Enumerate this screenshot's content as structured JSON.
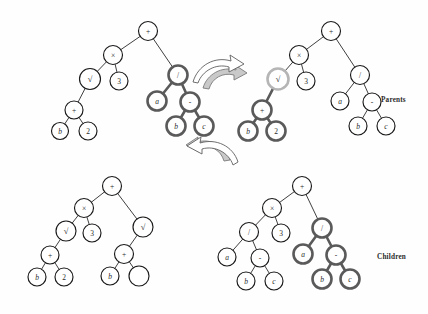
{
  "figure": {
    "type": "genetic-programming-crossover-diagram",
    "background": "#fefefe",
    "width": 428,
    "height": 314,
    "colors": {
      "node_stroke": "#1a1a1a",
      "node_fill": "#ffffff",
      "edge": "#2a2a2a",
      "highlight_bold": "#5a5a5a",
      "highlight_light": "#b5b5b5",
      "arrow_fill": "#c9c9c9",
      "arrow_stroke": "#6e6e6e",
      "text": "#2b2b2b"
    }
  },
  "labels": {
    "parents": "Parents",
    "children": "Children"
  },
  "icons": {
    "swap_arrow_top": "curved-swap-arrow-icon",
    "swap_arrow_bottom": "curved-swap-arrow-icon"
  },
  "trees": [
    {
      "id": "parent-1",
      "name": "parent-tree-left",
      "row": "parents",
      "nodes": [
        {
          "id": "p1-n0",
          "label": "+",
          "x": 148,
          "y": 31,
          "r": 9.5,
          "style": "normal"
        },
        {
          "id": "p1-n1",
          "label": "×",
          "x": 113,
          "y": 55,
          "r": 9.5,
          "style": "normal"
        },
        {
          "id": "p1-n2",
          "label": "√",
          "x": 90,
          "y": 79,
          "r": 10.5,
          "style": "normal"
        },
        {
          "id": "p1-n3",
          "label": "3",
          "x": 119,
          "y": 81,
          "r": 9.0,
          "style": "normal"
        },
        {
          "id": "p1-n4",
          "label": "+",
          "x": 74,
          "y": 110,
          "r": 9.0,
          "style": "normal"
        },
        {
          "id": "p1-n5",
          "label": "b",
          "x": 60,
          "y": 131,
          "r": 8.5,
          "style": "normal"
        },
        {
          "id": "p1-n6",
          "label": "2",
          "x": 88,
          "y": 131,
          "r": 9.0,
          "style": "normal"
        },
        {
          "id": "p1-n7",
          "label": "/",
          "x": 178,
          "y": 75,
          "r": 9.5,
          "style": "highlight-bold"
        },
        {
          "id": "p1-n8",
          "label": "a",
          "x": 157,
          "y": 101,
          "r": 9.5,
          "style": "highlight-bold"
        },
        {
          "id": "p1-n9",
          "label": "-",
          "x": 190,
          "y": 102,
          "r": 9.5,
          "style": "highlight-bold"
        },
        {
          "id": "p1-n10",
          "label": "b",
          "x": 176,
          "y": 126,
          "r": 9.5,
          "style": "highlight-bold"
        },
        {
          "id": "p1-n11",
          "label": "c",
          "x": 204,
          "y": 126,
          "r": 9.5,
          "style": "highlight-bold"
        }
      ],
      "edges": [
        {
          "from": "p1-n0",
          "to": "p1-n1",
          "style": "normal"
        },
        {
          "from": "p1-n0",
          "to": "p1-n7",
          "style": "normal"
        },
        {
          "from": "p1-n1",
          "to": "p1-n2",
          "style": "normal"
        },
        {
          "from": "p1-n1",
          "to": "p1-n3",
          "style": "normal"
        },
        {
          "from": "p1-n2",
          "to": "p1-n4",
          "style": "normal"
        },
        {
          "from": "p1-n4",
          "to": "p1-n5",
          "style": "normal"
        },
        {
          "from": "p1-n4",
          "to": "p1-n6",
          "style": "normal"
        },
        {
          "from": "p1-n7",
          "to": "p1-n8",
          "style": "highlight-bold"
        },
        {
          "from": "p1-n7",
          "to": "p1-n9",
          "style": "highlight-bold"
        },
        {
          "from": "p1-n9",
          "to": "p1-n10",
          "style": "highlight-bold"
        },
        {
          "from": "p1-n9",
          "to": "p1-n11",
          "style": "highlight-bold"
        }
      ]
    },
    {
      "id": "parent-2",
      "name": "parent-tree-right",
      "row": "parents",
      "nodes": [
        {
          "id": "p2-n0",
          "label": "+",
          "x": 331,
          "y": 31,
          "r": 9.5,
          "style": "normal"
        },
        {
          "id": "p2-n1",
          "label": "×",
          "x": 299,
          "y": 55,
          "r": 9.5,
          "style": "normal"
        },
        {
          "id": "p2-n2",
          "label": "√",
          "x": 278,
          "y": 79,
          "r": 10.5,
          "style": "highlight-light"
        },
        {
          "id": "p2-n3",
          "label": "3",
          "x": 306,
          "y": 81,
          "r": 9.0,
          "style": "normal"
        },
        {
          "id": "p2-n4",
          "label": "+",
          "x": 262,
          "y": 110,
          "r": 9.5,
          "style": "highlight-bold"
        },
        {
          "id": "p2-n5",
          "label": "b",
          "x": 248,
          "y": 131,
          "r": 9.5,
          "style": "highlight-bold"
        },
        {
          "id": "p2-n6",
          "label": "2",
          "x": 276,
          "y": 131,
          "r": 9.5,
          "style": "highlight-bold"
        },
        {
          "id": "p2-n7",
          "label": "/",
          "x": 360,
          "y": 75,
          "r": 9.5,
          "style": "normal"
        },
        {
          "id": "p2-n8",
          "label": "a",
          "x": 340,
          "y": 101,
          "r": 9.0,
          "style": "normal"
        },
        {
          "id": "p2-n9",
          "label": "-",
          "x": 372,
          "y": 102,
          "r": 9.0,
          "style": "normal"
        },
        {
          "id": "p2-n10",
          "label": "b",
          "x": 358,
          "y": 126,
          "r": 9.0,
          "style": "normal"
        },
        {
          "id": "p2-n11",
          "label": "c",
          "x": 386,
          "y": 126,
          "r": 9.0,
          "style": "normal"
        }
      ],
      "edges": [
        {
          "from": "p2-n0",
          "to": "p2-n1",
          "style": "normal"
        },
        {
          "from": "p2-n0",
          "to": "p2-n7",
          "style": "normal"
        },
        {
          "from": "p2-n1",
          "to": "p2-n2",
          "style": "normal"
        },
        {
          "from": "p2-n1",
          "to": "p2-n3",
          "style": "normal"
        },
        {
          "from": "p2-n2",
          "to": "p2-n4",
          "style": "highlight-bold"
        },
        {
          "from": "p2-n4",
          "to": "p2-n5",
          "style": "highlight-bold"
        },
        {
          "from": "p2-n4",
          "to": "p2-n6",
          "style": "highlight-bold"
        },
        {
          "from": "p2-n7",
          "to": "p2-n8",
          "style": "normal"
        },
        {
          "from": "p2-n7",
          "to": "p2-n9",
          "style": "normal"
        },
        {
          "from": "p2-n9",
          "to": "p2-n10",
          "style": "normal"
        },
        {
          "from": "p2-n9",
          "to": "p2-n11",
          "style": "normal"
        }
      ]
    },
    {
      "id": "child-1",
      "name": "child-tree-left",
      "row": "children",
      "nodes": [
        {
          "id": "c1-n0",
          "label": "+",
          "x": 112,
          "y": 186,
          "r": 9.5,
          "style": "normal"
        },
        {
          "id": "c1-n1",
          "label": "×",
          "x": 84,
          "y": 208,
          "r": 9.5,
          "style": "normal"
        },
        {
          "id": "c1-n2",
          "label": "√",
          "x": 66,
          "y": 231,
          "r": 10.0,
          "style": "normal"
        },
        {
          "id": "c1-n3",
          "label": "3",
          "x": 92,
          "y": 233,
          "r": 9.0,
          "style": "normal"
        },
        {
          "id": "c1-n4",
          "label": "+",
          "x": 50,
          "y": 255,
          "r": 9.0,
          "style": "normal"
        },
        {
          "id": "c1-n5",
          "label": "b",
          "x": 37,
          "y": 277,
          "r": 9.0,
          "style": "normal"
        },
        {
          "id": "c1-n6",
          "label": "2",
          "x": 64,
          "y": 277,
          "r": 9.0,
          "style": "normal"
        },
        {
          "id": "c1-n7",
          "label": "√",
          "x": 143,
          "y": 227,
          "r": 10.0,
          "style": "normal"
        },
        {
          "id": "c1-n8",
          "label": "+",
          "x": 124,
          "y": 254,
          "r": 9.5,
          "style": "normal"
        },
        {
          "id": "c1-n9",
          "label": "b",
          "x": 110,
          "y": 276,
          "r": 9.0,
          "style": "normal"
        },
        {
          "id": "c1-n10",
          "label": "",
          "x": 139,
          "y": 276,
          "r": 10.0,
          "style": "normal"
        }
      ],
      "edges": [
        {
          "from": "c1-n0",
          "to": "c1-n1",
          "style": "normal"
        },
        {
          "from": "c1-n0",
          "to": "c1-n7",
          "style": "normal"
        },
        {
          "from": "c1-n1",
          "to": "c1-n2",
          "style": "normal"
        },
        {
          "from": "c1-n1",
          "to": "c1-n3",
          "style": "normal"
        },
        {
          "from": "c1-n2",
          "to": "c1-n4",
          "style": "normal"
        },
        {
          "from": "c1-n4",
          "to": "c1-n5",
          "style": "normal"
        },
        {
          "from": "c1-n4",
          "to": "c1-n6",
          "style": "normal"
        },
        {
          "from": "c1-n7",
          "to": "c1-n8",
          "style": "normal"
        },
        {
          "from": "c1-n8",
          "to": "c1-n9",
          "style": "normal"
        },
        {
          "from": "c1-n8",
          "to": "c1-n10",
          "style": "normal"
        }
      ]
    },
    {
      "id": "child-2",
      "name": "child-tree-right",
      "row": "children",
      "nodes": [
        {
          "id": "c2-n0",
          "label": "+",
          "x": 302,
          "y": 186,
          "r": 9.5,
          "style": "normal"
        },
        {
          "id": "c2-n1",
          "label": "×",
          "x": 272,
          "y": 208,
          "r": 9.5,
          "style": "normal"
        },
        {
          "id": "c2-n2",
          "label": "/",
          "x": 249,
          "y": 232,
          "r": 9.5,
          "style": "normal"
        },
        {
          "id": "c2-n3",
          "label": "3",
          "x": 281,
          "y": 233,
          "r": 9.0,
          "style": "normal"
        },
        {
          "id": "c2-n4",
          "label": "a",
          "x": 227,
          "y": 257,
          "r": 9.0,
          "style": "normal"
        },
        {
          "id": "c2-n5",
          "label": "-",
          "x": 260,
          "y": 258,
          "r": 9.0,
          "style": "normal"
        },
        {
          "id": "c2-n6",
          "label": "b",
          "x": 246,
          "y": 281,
          "r": 9.0,
          "style": "normal"
        },
        {
          "id": "c2-n7",
          "label": "c",
          "x": 274,
          "y": 281,
          "r": 9.0,
          "style": "normal"
        },
        {
          "id": "c2-n8",
          "label": "/",
          "x": 322,
          "y": 228,
          "r": 9.5,
          "style": "highlight-bold"
        },
        {
          "id": "c2-n9",
          "label": "a",
          "x": 303,
          "y": 254,
          "r": 9.5,
          "style": "highlight-bold"
        },
        {
          "id": "c2-n10",
          "label": "-",
          "x": 336,
          "y": 255,
          "r": 9.5,
          "style": "highlight-bold"
        },
        {
          "id": "c2-n11",
          "label": "b",
          "x": 322,
          "y": 279,
          "r": 9.5,
          "style": "highlight-bold"
        },
        {
          "id": "c2-n12",
          "label": "c",
          "x": 350,
          "y": 279,
          "r": 9.5,
          "style": "highlight-bold"
        }
      ],
      "edges": [
        {
          "from": "c2-n0",
          "to": "c2-n1",
          "style": "normal"
        },
        {
          "from": "c2-n0",
          "to": "c2-n8",
          "style": "normal"
        },
        {
          "from": "c2-n1",
          "to": "c2-n2",
          "style": "normal"
        },
        {
          "from": "c2-n1",
          "to": "c2-n3",
          "style": "normal"
        },
        {
          "from": "c2-n2",
          "to": "c2-n4",
          "style": "normal"
        },
        {
          "from": "c2-n2",
          "to": "c2-n5",
          "style": "normal"
        },
        {
          "from": "c2-n5",
          "to": "c2-n6",
          "style": "normal"
        },
        {
          "from": "c2-n5",
          "to": "c2-n7",
          "style": "normal"
        },
        {
          "from": "c2-n8",
          "to": "c2-n9",
          "style": "highlight-bold"
        },
        {
          "from": "c2-n8",
          "to": "c2-n10",
          "style": "highlight-bold"
        },
        {
          "from": "c2-n10",
          "to": "c2-n11",
          "style": "highlight-bold"
        },
        {
          "from": "c2-n10",
          "to": "c2-n12",
          "style": "highlight-bold"
        }
      ]
    }
  ]
}
